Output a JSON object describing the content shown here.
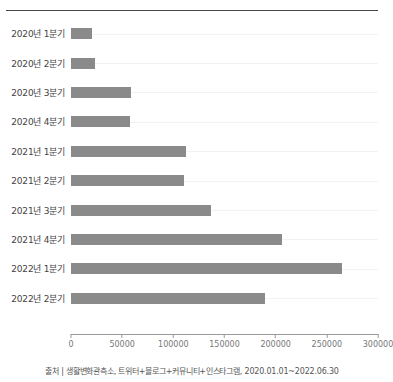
{
  "chart": {
    "title": "",
    "source_note": "출처 | 생활변화관측소, 트위터+블로그+커뮤니티+인스타그램, 2020.01.01~2022.06.30"
  },
  "chart_data": {
    "type": "bar",
    "orientation": "horizontal",
    "title": "",
    "xlabel": "",
    "ylabel": "",
    "xlim": [
      0,
      300000
    ],
    "grid": false,
    "bar_color": "#8a8a8a",
    "categories": [
      "2020년 1분기",
      "2020년 2분기",
      "2020년 3분기",
      "2020년 4분기",
      "2021년 1분기",
      "2021년 2분기",
      "2021년 3분기",
      "2021년 4분기",
      "2022년 1분기",
      "2022년 2분기"
    ],
    "values": [
      21000,
      23000,
      59000,
      58000,
      112000,
      110000,
      137000,
      206000,
      265000,
      190000
    ],
    "xticks": [
      0,
      50000,
      100000,
      150000,
      200000,
      250000,
      300000
    ],
    "xtick_labels": [
      "0",
      "50000",
      "100000",
      "150000",
      "200000",
      "250000",
      "300000"
    ]
  }
}
